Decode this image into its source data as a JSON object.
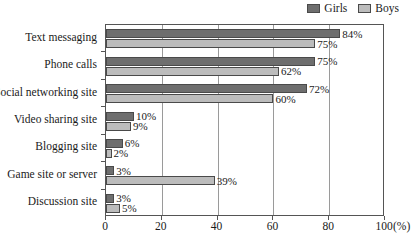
{
  "chart_data": {
    "type": "bar",
    "orientation": "horizontal",
    "title": "",
    "subtitle": "",
    "xlabel": "(%)",
    "ylabel": "",
    "xlim": [
      0,
      100
    ],
    "xticks": [
      0,
      20,
      40,
      60,
      80,
      100
    ],
    "xtick_labels": [
      "0",
      "20",
      "40",
      "60",
      "80",
      "100"
    ],
    "grid": true,
    "grid_axis": "x",
    "legend_position": "top-right",
    "categories": [
      "Text messaging",
      "Phone calls",
      "Social networking site",
      "Video sharing site",
      "Blogging site",
      "Game site or server",
      "Discussion site"
    ],
    "series": [
      {
        "name": "Girls",
        "color": "#6e6e6e",
        "values": [
          84,
          75,
          72,
          10,
          6,
          3,
          3
        ],
        "labels": [
          "84%",
          "75%",
          "72%",
          "10%",
          "6%",
          "3%",
          "3%"
        ]
      },
      {
        "name": "Boys",
        "color": "#bcbcbc",
        "values": [
          75,
          62,
          60,
          9,
          2,
          39,
          5
        ],
        "labels": [
          "75%",
          "62%",
          "60%",
          "9%",
          "2%",
          "39%",
          "5%"
        ]
      }
    ]
  },
  "legend": {
    "entries": [
      {
        "label": "Girls",
        "color": "#6e6e6e"
      },
      {
        "label": "Boys",
        "color": "#bcbcbc"
      }
    ]
  },
  "axis": {
    "unit_label": "(%)"
  }
}
